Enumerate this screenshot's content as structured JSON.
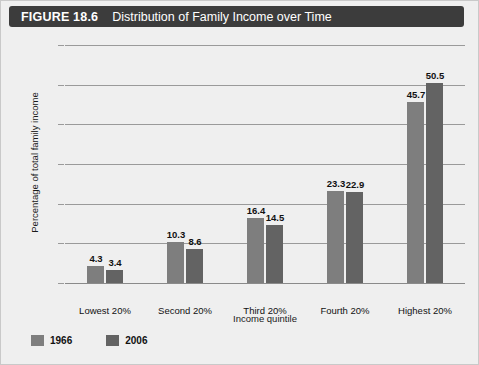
{
  "header": {
    "figure_number": "FIGURE 18.6",
    "title": "Distribution of Family Income over Time",
    "bar_color": "#3c3c3c"
  },
  "chart_data": {
    "type": "bar",
    "title": "Distribution of Family Income over Time",
    "xlabel": "Income quintile",
    "ylabel": "Percentage of total family income",
    "categories": [
      "Lowest 20%",
      "Second 20%",
      "Third 20%",
      "Fourth 20%",
      "Highest 20%"
    ],
    "series": [
      {
        "name": "1966",
        "color": "#7e7e7e",
        "values": [
          4.3,
          10.3,
          16.4,
          23.3,
          45.7
        ]
      },
      {
        "name": "2006",
        "color": "#636363",
        "values": [
          3.4,
          8.6,
          14.5,
          22.9,
          50.5
        ]
      }
    ],
    "ylim": [
      0,
      60
    ],
    "yticks": [
      0,
      10,
      20,
      30,
      40,
      50,
      60
    ],
    "ytick_labels": [
      "0",
      "10",
      "20",
      "30",
      "40",
      "50",
      "60"
    ],
    "grid": true,
    "legend_position": "bottom-left",
    "value_labels": [
      [
        "4.3",
        "3.4"
      ],
      [
        "10.3",
        "8.6"
      ],
      [
        "16.4",
        "14.5"
      ],
      [
        "23.3",
        "22.9"
      ],
      [
        "45.7",
        "50.5"
      ]
    ],
    "plot_background": "#ededed"
  }
}
